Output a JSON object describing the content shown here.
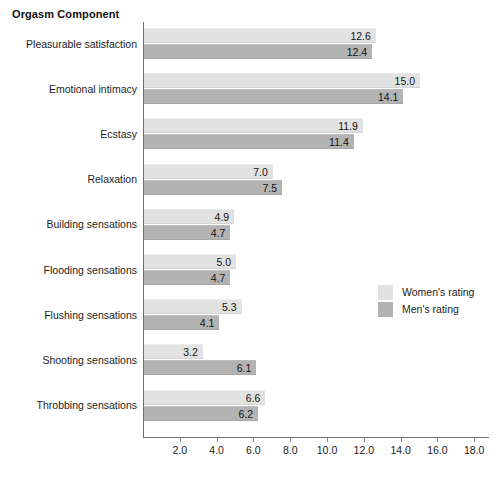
{
  "chart_data": {
    "type": "bar",
    "orientation": "horizontal",
    "title": "Orgasm Component",
    "xlabel": "",
    "ylabel": "",
    "xlim": [
      0,
      18.8
    ],
    "grid": false,
    "legend_position": "middle-right",
    "xticks": [
      "2.0",
      "4.0",
      "6.0",
      "8.0",
      "10.0",
      "12.0",
      "14.0",
      "16.0",
      "18.0"
    ],
    "xtick_values": [
      2.0,
      4.0,
      6.0,
      8.0,
      10.0,
      12.0,
      14.0,
      16.0,
      18.0
    ],
    "categories": [
      "Pleasurable satisfaction",
      "Emotional intimacy",
      "Ecstasy",
      "Relaxation",
      "Building sensations",
      "Flooding sensations",
      "Flushing sensations",
      "Shooting sensations",
      "Throbbing sensations"
    ],
    "series": [
      {
        "name": "Women's rating",
        "color": "#e2e2e2",
        "values": [
          12.6,
          15.0,
          11.9,
          7.0,
          4.9,
          5.0,
          5.3,
          3.2,
          6.6
        ],
        "labels": [
          "12.6",
          "15.0",
          "11.9",
          "7.0",
          "4.9",
          "5.0",
          "5.3",
          "3.2",
          "6.6"
        ]
      },
      {
        "name": "Men's rating",
        "color": "#b3b3b3",
        "values": [
          12.4,
          14.1,
          11.4,
          7.5,
          4.7,
          4.7,
          4.1,
          6.1,
          6.2
        ],
        "labels": [
          "12.4",
          "14.1",
          "11.4",
          "7.5",
          "4.7",
          "4.7",
          "4.1",
          "6.1",
          "6.2"
        ]
      }
    ]
  },
  "legend": {
    "items": [
      {
        "label": "Women's rating",
        "swatch": "women"
      },
      {
        "label": "Men's rating",
        "swatch": "men"
      }
    ]
  },
  "colors": {
    "women_bar": "#e2e2e2",
    "men_bar": "#b3b3b3",
    "axis": "#6e6e6e",
    "text": "#1c1c1c",
    "background": "#ffffff"
  }
}
